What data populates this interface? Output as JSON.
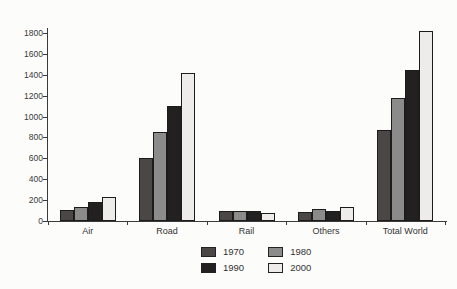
{
  "chart_data": {
    "type": "bar",
    "title": "",
    "xlabel": "",
    "ylabel": "",
    "categories": [
      "Air",
      "Road",
      "Rail",
      "Others",
      "Total World"
    ],
    "series": [
      {
        "name": "1970",
        "color": "#4a4746",
        "values": [
          105,
          600,
          100,
          90,
          875
        ]
      },
      {
        "name": "1980",
        "color": "#8b8b8b",
        "values": [
          135,
          850,
          100,
          115,
          1175
        ]
      },
      {
        "name": "1990",
        "color": "#232021",
        "values": [
          185,
          1105,
          95,
          100,
          1450
        ]
      },
      {
        "name": "2000",
        "color": "#edecea",
        "values": [
          230,
          1420,
          80,
          135,
          1820
        ]
      }
    ],
    "ylim": [
      0,
      1800
    ],
    "ytick_step": 200,
    "yticks": [
      "0",
      "200",
      "400",
      "600",
      "800",
      "1000",
      "1200",
      "1400",
      "1600",
      "1800"
    ],
    "grid": false,
    "legend_position": "bottom-center",
    "legend_rows": [
      [
        "1970",
        "1980"
      ],
      [
        "1990",
        "2000"
      ]
    ]
  },
  "style": {
    "background": "#fcfcfa",
    "axis_color": "#3a3a3a",
    "text_color": "#333333",
    "bar_border_color": "#1c1c1c"
  }
}
